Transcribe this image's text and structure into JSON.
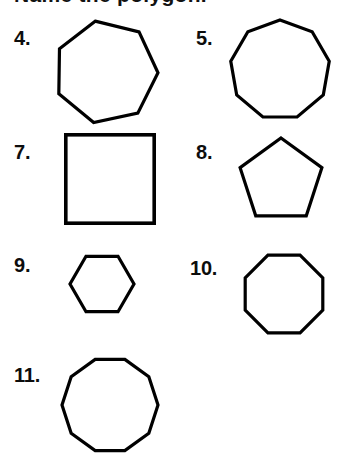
{
  "page": {
    "background_color": "#ffffff",
    "stroke_color": "#000000",
    "text_color": "#0d0d0d",
    "heading_partial": "Name the polygon."
  },
  "items": [
    {
      "number": "4.",
      "shape_name": "heptagon",
      "sides": 7,
      "number_x": 14,
      "number_y": 28,
      "shape_x": 52,
      "shape_y": 18,
      "size": 108,
      "rotation": -12
    },
    {
      "number": "5.",
      "shape_name": "nonagon",
      "sides": 9,
      "number_x": 196,
      "number_y": 28,
      "shape_x": 228,
      "shape_y": 18,
      "size": 104,
      "rotation": 0
    },
    {
      "number": "7.",
      "shape_name": "square",
      "sides": 4,
      "number_x": 14,
      "number_y": 142,
      "shape_x": 64,
      "shape_y": 133,
      "size": 92,
      "rotation": 0
    },
    {
      "number": "8.",
      "shape_name": "pentagon",
      "sides": 5,
      "number_x": 196,
      "number_y": 142,
      "shape_x": 236,
      "shape_y": 136,
      "size": 90,
      "rotation": 0
    },
    {
      "number": "9.",
      "shape_name": "hexagon",
      "sides": 6,
      "number_x": 14,
      "number_y": 255,
      "shape_x": 68,
      "shape_y": 250,
      "size": 68,
      "rotation": 0
    },
    {
      "number": "10.",
      "shape_name": "octagon",
      "sides": 8,
      "number_x": 190,
      "number_y": 258,
      "shape_x": 240,
      "shape_y": 250,
      "size": 88,
      "rotation": 0
    },
    {
      "number": "11.",
      "shape_name": "decagon",
      "sides": 10,
      "number_x": 14,
      "number_y": 365,
      "shape_x": 60,
      "shape_y": 355,
      "size": 100,
      "rotation": 0
    }
  ]
}
